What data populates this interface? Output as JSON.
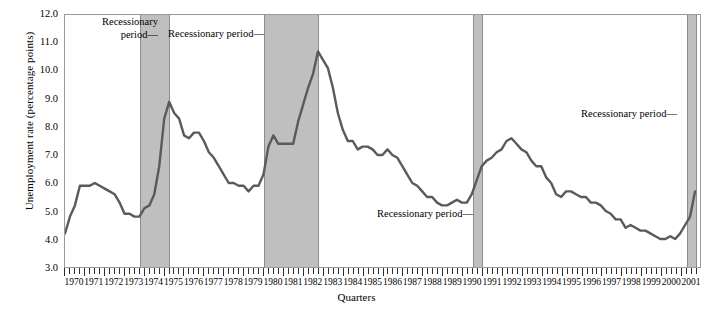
{
  "chart_data": {
    "type": "line",
    "title": "",
    "xlabel": "Quarters",
    "ylabel": "Unemployment rate (percentage points)",
    "ylim": [
      3.0,
      12.0
    ],
    "xlim": [
      1970.0,
      2002.0
    ],
    "grid": false,
    "legend": "none",
    "y_ticks": [
      "12.0",
      "11.0",
      "10.0",
      "9.0",
      "8.0",
      "7.0",
      "6.0",
      "5.0",
      "4.0",
      "3.0"
    ],
    "y_tick_values": [
      12.0,
      11.0,
      10.0,
      9.0,
      8.0,
      7.0,
      6.0,
      5.0,
      4.0,
      3.0
    ],
    "x_tick_labels": [
      "1970",
      "1971",
      "1972",
      "1973",
      "1974",
      "1975",
      "1976",
      "1977",
      "1978",
      "1979",
      "1980",
      "1981",
      "1982",
      "1983",
      "1984",
      "1985",
      "1986",
      "1987",
      "1988",
      "1989",
      "1990",
      "1991",
      "1992",
      "1993",
      "1994",
      "1995",
      "1996",
      "1997",
      "1998",
      "1999",
      "2000",
      "2001"
    ],
    "series": [
      {
        "name": "Unemployment rate",
        "color": "#5a5a5a",
        "x": [
          1970.0,
          1970.25,
          1970.5,
          1970.75,
          1971.0,
          1971.25,
          1971.5,
          1971.75,
          1972.0,
          1972.25,
          1972.5,
          1972.75,
          1973.0,
          1973.25,
          1973.5,
          1973.75,
          1974.0,
          1974.25,
          1974.5,
          1974.75,
          1975.0,
          1975.25,
          1975.5,
          1975.75,
          1976.0,
          1976.25,
          1976.5,
          1976.75,
          1977.0,
          1977.25,
          1977.5,
          1977.75,
          1978.0,
          1978.25,
          1978.5,
          1978.75,
          1979.0,
          1979.25,
          1979.5,
          1979.75,
          1980.0,
          1980.25,
          1980.5,
          1980.75,
          1981.0,
          1981.25,
          1981.5,
          1981.75,
          1982.0,
          1982.25,
          1982.5,
          1982.75,
          1983.0,
          1983.25,
          1983.5,
          1983.75,
          1984.0,
          1984.25,
          1984.5,
          1984.75,
          1985.0,
          1985.25,
          1985.5,
          1985.75,
          1986.0,
          1986.25,
          1986.5,
          1986.75,
          1987.0,
          1987.25,
          1987.5,
          1987.75,
          1988.0,
          1988.25,
          1988.5,
          1988.75,
          1989.0,
          1989.25,
          1989.5,
          1989.75,
          1990.0,
          1990.25,
          1990.5,
          1990.75,
          1991.0,
          1991.25,
          1991.5,
          1991.75,
          1992.0,
          1992.25,
          1992.5,
          1992.75,
          1993.0,
          1993.25,
          1993.5,
          1993.75,
          1994.0,
          1994.25,
          1994.5,
          1994.75,
          1995.0,
          1995.25,
          1995.5,
          1995.75,
          1996.0,
          1996.25,
          1996.5,
          1996.75,
          1997.0,
          1997.25,
          1997.5,
          1997.75,
          1998.0,
          1998.25,
          1998.5,
          1998.75,
          1999.0,
          1999.25,
          1999.5,
          1999.75,
          2000.0,
          2000.25,
          2000.5,
          2000.75,
          2001.0,
          2001.25,
          2001.5,
          2001.75
        ],
        "values": [
          4.2,
          4.8,
          5.2,
          5.9,
          5.9,
          5.9,
          6.0,
          5.9,
          5.8,
          5.7,
          5.6,
          5.3,
          4.9,
          4.9,
          4.8,
          4.8,
          5.1,
          5.2,
          5.6,
          6.6,
          8.3,
          8.9,
          8.5,
          8.3,
          7.7,
          7.6,
          7.8,
          7.8,
          7.5,
          7.1,
          6.9,
          6.6,
          6.3,
          6.0,
          6.0,
          5.9,
          5.9,
          5.7,
          5.9,
          5.9,
          6.3,
          7.3,
          7.7,
          7.4,
          7.4,
          7.4,
          7.4,
          8.2,
          8.8,
          9.4,
          9.9,
          10.7,
          10.4,
          10.1,
          9.4,
          8.5,
          7.9,
          7.5,
          7.5,
          7.2,
          7.3,
          7.3,
          7.2,
          7.0,
          7.0,
          7.2,
          7.0,
          6.9,
          6.6,
          6.3,
          6.0,
          5.9,
          5.7,
          5.5,
          5.5,
          5.3,
          5.2,
          5.2,
          5.3,
          5.4,
          5.3,
          5.3,
          5.6,
          6.1,
          6.6,
          6.8,
          6.9,
          7.1,
          7.2,
          7.5,
          7.6,
          7.4,
          7.2,
          7.1,
          6.8,
          6.6,
          6.6,
          6.2,
          6.0,
          5.6,
          5.5,
          5.7,
          5.7,
          5.6,
          5.5,
          5.5,
          5.3,
          5.3,
          5.2,
          5.0,
          4.9,
          4.7,
          4.7,
          4.4,
          4.5,
          4.4,
          4.3,
          4.3,
          4.2,
          4.1,
          4.0,
          4.0,
          4.1,
          4.0,
          4.2,
          4.5,
          4.8,
          5.7
        ]
      }
    ],
    "recession_bands": [
      {
        "start": 1973.75,
        "end": 1975.25,
        "label": "Recessionary period"
      },
      {
        "start": 1980.0,
        "end": 1982.75,
        "label": "Recessionary period"
      },
      {
        "start": 1990.5,
        "end": 1991.0,
        "label": "Recessionary period"
      },
      {
        "start": 2001.25,
        "end": 2001.75,
        "label": "Recessionary period"
      }
    ],
    "annotations": [
      {
        "text": "Recessionary period—",
        "id": "anno-1"
      },
      {
        "text": "Recessionary period—",
        "id": "anno-2"
      },
      {
        "text": "Recessionary period—",
        "id": "anno-3"
      },
      {
        "text": "Recessionary period—",
        "id": "anno-4"
      }
    ]
  },
  "annotations": {
    "a1_line1": "Recessionary",
    "a1_line2": "period—",
    "a2": "Recessionary period—",
    "a3": "Recessionary period—",
    "a4": "Recessionary period—"
  },
  "colors": {
    "line": "#5a5a5a",
    "band": "#bfbfbf",
    "frame": "#9a9a9a",
    "tick": "#2b2b2b"
  }
}
